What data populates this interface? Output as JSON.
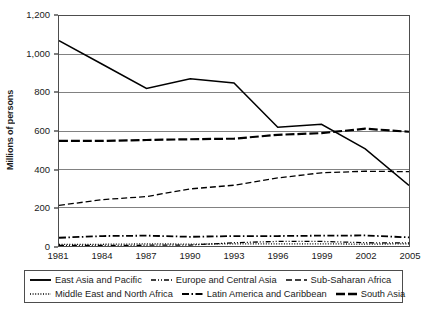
{
  "axes": {
    "ylabel": "Millions of persons",
    "yticks": [
      "0",
      "200",
      "400",
      "600",
      "800",
      "1,000",
      "1,200"
    ],
    "xticks": [
      "1981",
      "1984",
      "1987",
      "1990",
      "1993",
      "1996",
      "1999",
      "2002",
      "2005"
    ]
  },
  "legend": {
    "row1": [
      {
        "label": "East Asia and Pacific",
        "style": "solid"
      },
      {
        "label": "Europe and Central Asia",
        "style": "dash-dot-dot"
      },
      {
        "label": "Sub-Saharan Africa",
        "style": "dashed"
      }
    ],
    "row2": [
      {
        "label": "Middle East and North Africa",
        "style": "dotted"
      },
      {
        "label": "Latin America and Caribbean",
        "style": "dash-dot"
      },
      {
        "label": "South Asia",
        "style": "long-dash-dot"
      }
    ]
  },
  "chart_data": {
    "type": "line",
    "title": "",
    "xlabel": "",
    "ylabel": "Millions of persons",
    "xlim": [
      1981,
      2005
    ],
    "ylim": [
      0,
      1200
    ],
    "grid": "horizontal",
    "legend_position": "bottom",
    "x": [
      1981,
      1984,
      1987,
      1990,
      1993,
      1996,
      1999,
      2002,
      2005
    ],
    "series": [
      {
        "name": "East Asia and Pacific",
        "style": "solid",
        "color": "#000000",
        "values": [
          1072,
          947,
          822,
          872,
          850,
          620,
          635,
          507,
          316
        ]
      },
      {
        "name": "South Asia",
        "style": "long-dash-dot",
        "color": "#000000",
        "values": [
          548,
          548,
          553,
          557,
          560,
          580,
          589,
          612,
          596
        ]
      },
      {
        "name": "Sub-Saharan Africa",
        "style": "dashed",
        "color": "#000000",
        "values": [
          212,
          242,
          258,
          298,
          317,
          355,
          382,
          390,
          388
        ]
      },
      {
        "name": "Latin America and Caribbean",
        "style": "dash-dot",
        "color": "#000000",
        "values": [
          43,
          52,
          54,
          48,
          52,
          52,
          54,
          55,
          45
        ]
      },
      {
        "name": "Europe and Central Asia",
        "style": "dash-dot-dot",
        "color": "#000000",
        "values": [
          3,
          3,
          4,
          5,
          17,
          24,
          24,
          17,
          16
        ]
      },
      {
        "name": "Middle East and North Africa",
        "style": "dotted",
        "color": "#000000",
        "values": [
          9,
          9,
          11,
          10,
          11,
          11,
          11,
          10,
          11
        ]
      }
    ]
  }
}
